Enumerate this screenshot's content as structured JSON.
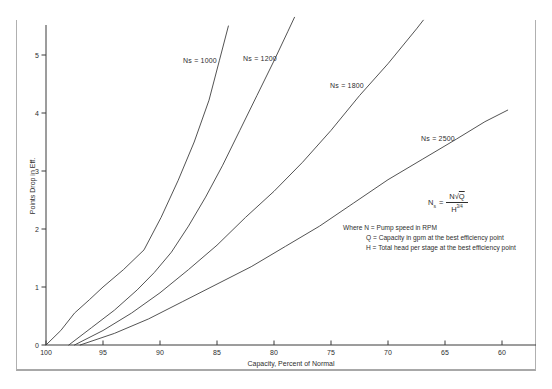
{
  "colors": {
    "line": "#3f3f3f",
    "axis": "#3a3a3a",
    "frame": "#b0b0b0",
    "text": "#2e2e2e"
  },
  "formula": {
    "lhs": "N",
    "lhs_sub": "s",
    "equals": "=",
    "num_n": "N",
    "sqrt_sign": "√",
    "num_q": "Q",
    "den_base": "H",
    "den_exp": "3/4"
  },
  "where": {
    "l1": "Where N = Pump speed in RPM",
    "l2": "Q = Capacity in gpm at the best efficiency point",
    "l3": "H = Total head per stage at the best efficiency point"
  },
  "chart_data": {
    "type": "line",
    "title": "",
    "xlabel": "Capacity, Percent of Normal",
    "ylabel": "Points Drop in Eff.",
    "x_axis": {
      "min": 100,
      "max": 57,
      "reversed": true,
      "ticks": [
        100,
        95,
        90,
        85,
        80,
        75,
        70,
        65,
        60
      ]
    },
    "y_axis": {
      "min": 0,
      "max": 5.6,
      "ticks": [
        0,
        1,
        2,
        3,
        4,
        5
      ]
    },
    "grid": false,
    "series": [
      {
        "name": "Ns = 1000",
        "label_xy": [
          200,
          60
        ],
        "points": [
          [
            100,
            0
          ],
          [
            98.7,
            0.25
          ],
          [
            97.5,
            0.55
          ],
          [
            96.2,
            0.78
          ],
          [
            95,
            1.0
          ],
          [
            93.2,
            1.3
          ],
          [
            91.4,
            1.64
          ],
          [
            89.9,
            2.2
          ],
          [
            88.4,
            2.84
          ],
          [
            87,
            3.5
          ],
          [
            85.7,
            4.22
          ],
          [
            84.8,
            4.9
          ],
          [
            84,
            5.5
          ]
        ]
      },
      {
        "name": "Ns = 1200",
        "label_xy": [
          260,
          58
        ],
        "points": [
          [
            98,
            0
          ],
          [
            96,
            0.3
          ],
          [
            94,
            0.6
          ],
          [
            92,
            0.95
          ],
          [
            90.5,
            1.25
          ],
          [
            89,
            1.6
          ],
          [
            87.5,
            2.05
          ],
          [
            86,
            2.55
          ],
          [
            84.5,
            3.1
          ],
          [
            83,
            3.7
          ],
          [
            81.5,
            4.3
          ],
          [
            80,
            4.9
          ],
          [
            78.8,
            5.4
          ],
          [
            78.2,
            5.65
          ]
        ]
      },
      {
        "name": "Ns = 1800",
        "label_xy": [
          347,
          85
        ],
        "points": [
          [
            97.5,
            0
          ],
          [
            95,
            0.25
          ],
          [
            92.5,
            0.55
          ],
          [
            90,
            0.9
          ],
          [
            87.5,
            1.3
          ],
          [
            85,
            1.72
          ],
          [
            82.5,
            2.2
          ],
          [
            80,
            2.65
          ],
          [
            77.5,
            3.15
          ],
          [
            75,
            3.7
          ],
          [
            72.5,
            4.3
          ],
          [
            70,
            4.85
          ],
          [
            67.5,
            5.45
          ],
          [
            66.9,
            5.6
          ]
        ]
      },
      {
        "name": "Ns = 2500",
        "label_xy": [
          438,
          138
        ],
        "points": [
          [
            97,
            0
          ],
          [
            94,
            0.2
          ],
          [
            91,
            0.45
          ],
          [
            88,
            0.75
          ],
          [
            85,
            1.05
          ],
          [
            82,
            1.35
          ],
          [
            79,
            1.7
          ],
          [
            76,
            2.05
          ],
          [
            73,
            2.45
          ],
          [
            70,
            2.85
          ],
          [
            67,
            3.2
          ],
          [
            64,
            3.55
          ],
          [
            61.5,
            3.85
          ],
          [
            59.5,
            4.05
          ]
        ]
      }
    ],
    "legend_position": "none",
    "annotation_formula": "Ns = N√Q / H^(3/4)"
  }
}
